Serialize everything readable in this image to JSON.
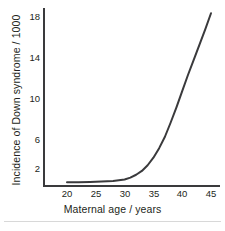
{
  "chart_data": {
    "type": "line",
    "title": "",
    "xlabel": "Maternal age / years",
    "ylabel": "Incidence of Down syndrome / 1000",
    "xlim": [
      18,
      46
    ],
    "ylim": [
      0,
      19
    ],
    "xticks": [
      20,
      25,
      30,
      35,
      40,
      45
    ],
    "xtick_labels": [
      "20",
      "25",
      "30",
      "35",
      "40",
      "45"
    ],
    "yticks": [
      2,
      6,
      10,
      14,
      18
    ],
    "ytick_labels": [
      "2",
      "6",
      "10",
      "14",
      "18"
    ],
    "grid": false,
    "legend": null,
    "series": [
      {
        "name": "Incidence of Down syndrome",
        "x": [
          20,
          22,
          24,
          26,
          28,
          30,
          31,
          32,
          33,
          34,
          35,
          36,
          37,
          38,
          39,
          40,
          41,
          42,
          43,
          44,
          45
        ],
        "y": [
          0.7,
          0.7,
          0.75,
          0.8,
          0.85,
          1.0,
          1.2,
          1.5,
          1.9,
          2.5,
          3.3,
          4.3,
          5.5,
          7.0,
          8.6,
          10.3,
          12.0,
          13.6,
          15.2,
          16.8,
          18.5
        ],
        "color": "#3a3a3c",
        "line_width": 2.0
      }
    ]
  },
  "figure": {
    "background_color": "#ffffff",
    "axis_color": "#3a3a3c",
    "text_color": "#231f20",
    "rule_color": "#d8d8d8"
  }
}
